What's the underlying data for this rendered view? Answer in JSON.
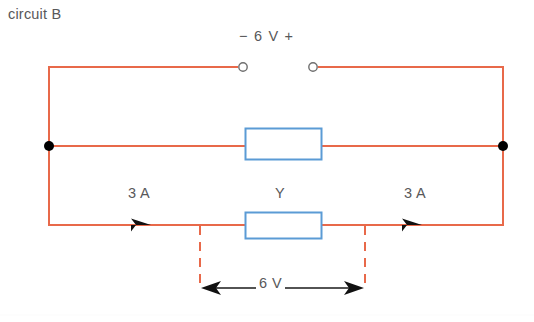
{
  "figure": {
    "caption": "circuit B",
    "supply": {
      "label": "−  6 V  +",
      "negative_sign": "−",
      "voltage": "6 V",
      "positive_sign": "+",
      "left_terminal": "open-terminal",
      "right_terminal": "open-terminal"
    },
    "components": [
      {
        "name": "upper-resistor",
        "label": ""
      },
      {
        "name": "lower-resistor",
        "label": "Y"
      }
    ],
    "currents": [
      {
        "name": "left-branch-current",
        "label": "3 A",
        "direction": "right"
      },
      {
        "name": "right-branch-current",
        "label": "3 A",
        "direction": "right"
      }
    ],
    "dimension": {
      "label": "6 V",
      "style": "double-headed-arrow"
    },
    "colors": {
      "wire": "#e8694a",
      "component_border": "#5b9bd5",
      "component_fill": "#ffffff",
      "node": "#000000",
      "dashed_guide": "#e8694a",
      "text": "#58585a",
      "arrow": "#1a1a1a"
    }
  }
}
